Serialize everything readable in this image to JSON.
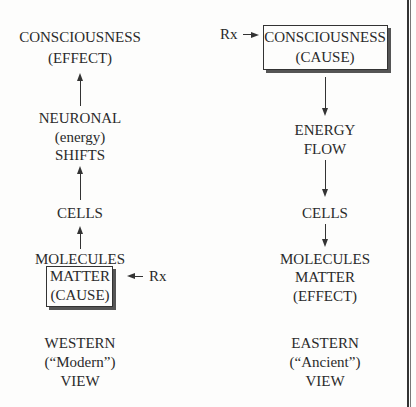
{
  "western": {
    "top": [
      "CONSCIOUSNESS",
      "(EFFECT)"
    ],
    "neuronal": [
      "NEURONAL",
      "(energy)",
      "SHIFTS"
    ],
    "cells": "CELLS",
    "molecules": "MOLECULES",
    "box": [
      "MATTER",
      "(CAUSE)"
    ],
    "rx": "Rx",
    "caption": [
      "WESTERN",
      "(“Modern”)",
      "VIEW"
    ]
  },
  "eastern": {
    "rx": "Rx",
    "box": [
      "CONSCIOUSNESS",
      "(CAUSE)"
    ],
    "energy": [
      "ENERGY",
      "FLOW"
    ],
    "cells": "CELLS",
    "bottom": [
      "MOLECULES",
      "MATTER",
      "(EFFECT)"
    ],
    "caption": [
      "EASTERN",
      "(“Ancient”)",
      "VIEW"
    ]
  }
}
